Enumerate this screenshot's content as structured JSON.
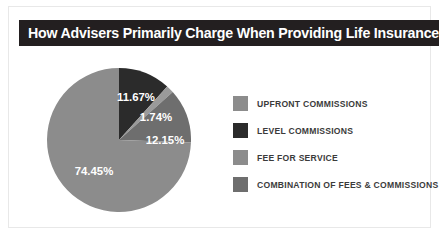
{
  "header": {
    "title": "How Advisers Primarily Charge When Providing Life Insurance",
    "background_color": "#231f20",
    "text_color": "#ffffff"
  },
  "legend": {
    "position": "right",
    "items": [
      {
        "label": "UPFRONT COMMISSIONS",
        "color": "#8c8c8c"
      },
      {
        "label": "LEVEL COMMISSIONS",
        "color": "#2b2b2b"
      },
      {
        "label": "FEE FOR SERVICE",
        "color": "#8c8c8c"
      },
      {
        "label": "COMBINATION OF FEES & COMMISSIONS",
        "color": "#6e6e6e"
      }
    ]
  },
  "chart_data": {
    "type": "pie",
    "title": "How Advisers Primarily Charge When Providing Life Insurance",
    "xlabel": "",
    "ylabel": "",
    "start_angle_deg": 0,
    "direction": "clockwise",
    "categories": [
      "UPFRONT COMMISSIONS",
      "LEVEL COMMISSIONS",
      "FEE FOR SERVICE",
      "COMBINATION OF FEES & COMMISSIONS"
    ],
    "values": [
      74.45,
      11.67,
      1.74,
      12.15
    ],
    "slices": [
      {
        "label": "LEVEL COMMISSIONS",
        "value": 11.67,
        "display": "11.67%",
        "color": "#2b2b2b"
      },
      {
        "label": "FEE FOR SERVICE",
        "value": 1.74,
        "display": "1.74%",
        "color": "#9a9a9a"
      },
      {
        "label": "COMBINATION OF FEES & COMMISSIONS",
        "value": 12.15,
        "display": "12.15%",
        "color": "#6e6e6e"
      },
      {
        "label": "UPFRONT COMMISSIONS",
        "value": 74.45,
        "display": "74.45%",
        "color": "#8c8c8c"
      }
    ],
    "labels": [
      "11.67%",
      "1.74%",
      "12.15%",
      "74.45%"
    ],
    "units": "percent",
    "total": 100.01
  }
}
